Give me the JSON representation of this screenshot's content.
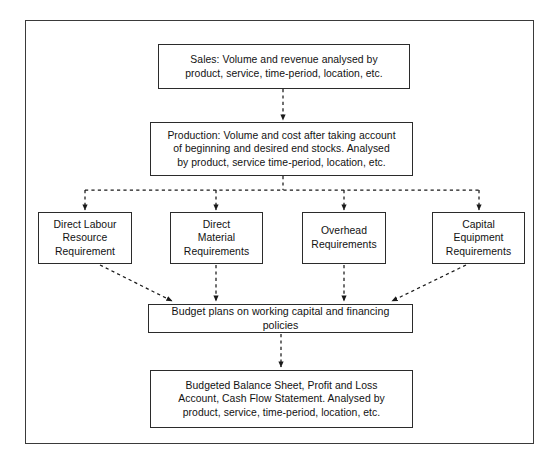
{
  "diagram": {
    "border_color": "#3a3a3a",
    "node_border_color": "#2b2b2b",
    "connector_color": "#1a1a1a",
    "connector_style": "dashed",
    "nodes": {
      "sales": {
        "id": "sales",
        "lines": [
          "Sales: Volume and revenue analysed by",
          "product, service, time-period, location, etc."
        ]
      },
      "production": {
        "id": "production",
        "lines": [
          "Production: Volume and cost after taking account",
          "of beginning and desired end stocks. Analysed",
          "by product, service time-period, location, etc."
        ]
      },
      "labour": {
        "id": "labour",
        "lines": [
          "Direct Labour",
          "Resource",
          "Requirement"
        ]
      },
      "material": {
        "id": "material",
        "lines": [
          "Direct",
          "Material",
          "Requirements"
        ]
      },
      "overhead": {
        "id": "overhead",
        "lines": [
          "Overhead",
          "Requirements"
        ]
      },
      "capital": {
        "id": "capital",
        "lines": [
          "Capital",
          "Equipment",
          "Requirements"
        ]
      },
      "budget": {
        "id": "budget",
        "lines": [
          "Budget plans on working capital and financing policies"
        ]
      },
      "statements": {
        "id": "statements",
        "lines": [
          "Budgeted Balance Sheet, Profit and Loss",
          "Account, Cash Flow Statement. Analysed by",
          "product, service, time-period, location, etc."
        ]
      }
    },
    "edges": [
      {
        "from": "sales",
        "to": "production"
      },
      {
        "from": "production",
        "to": "labour"
      },
      {
        "from": "production",
        "to": "material"
      },
      {
        "from": "production",
        "to": "overhead"
      },
      {
        "from": "production",
        "to": "capital"
      },
      {
        "from": "labour",
        "to": "budget"
      },
      {
        "from": "material",
        "to": "budget"
      },
      {
        "from": "overhead",
        "to": "budget"
      },
      {
        "from": "capital",
        "to": "budget"
      },
      {
        "from": "budget",
        "to": "statements"
      }
    ]
  }
}
